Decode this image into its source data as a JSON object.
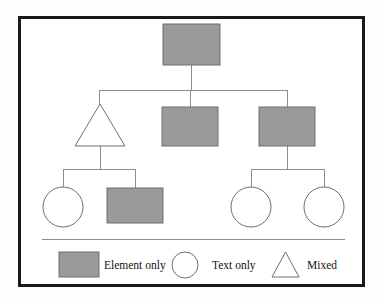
{
  "figure": {
    "name": "document-tree-diagram",
    "background_color": "#fdfdfd",
    "canvas_color": "#ffffff",
    "frame": {
      "border_color": "#1c1a19",
      "border_width": 3,
      "x": 18,
      "y": 16,
      "width": 347,
      "height": 271
    },
    "line_color": "#8c8c8c",
    "shape_stroke_color": "#6f6f6f",
    "element_fill_color": "#9a9a9a",
    "text_fill_color": "#ffffff",
    "separator": {
      "color": "#8c8c8c",
      "x1": 42,
      "x2": 345,
      "y": 239
    }
  },
  "tree": {
    "nodes": [
      {
        "id": "root",
        "shape": "rectangle",
        "category": "Element only",
        "level": 0,
        "x": 163,
        "y": 24,
        "width": 57,
        "height": 41,
        "cx": 191.5,
        "cy": 44.5
      },
      {
        "id": "n1",
        "shape": "triangle",
        "category": "Mixed",
        "level": 1,
        "apex_x": 100,
        "apex_y": 104,
        "base_left_x": 75,
        "base_right_x": 125,
        "base_y": 146,
        "cx": 100,
        "cy": 146
      },
      {
        "id": "n2",
        "shape": "rectangle",
        "category": "Element only",
        "level": 1,
        "x": 162,
        "y": 107,
        "width": 56,
        "height": 39,
        "cx": 190,
        "cy": 126.5
      },
      {
        "id": "n3",
        "shape": "rectangle",
        "category": "Element only",
        "level": 1,
        "x": 259,
        "y": 107,
        "width": 56,
        "height": 39,
        "cx": 287,
        "cy": 126.5
      },
      {
        "id": "n4",
        "shape": "circle",
        "category": "Text only",
        "level": 2,
        "cx": 63,
        "cy": 207,
        "r": 20
      },
      {
        "id": "n5",
        "shape": "rectangle",
        "category": "Element only",
        "level": 2,
        "x": 107,
        "y": 188,
        "width": 56,
        "height": 35,
        "cx": 135,
        "cy": 205.5
      },
      {
        "id": "n6",
        "shape": "circle",
        "category": "Text only",
        "level": 2,
        "cx": 251,
        "cy": 207,
        "r": 20
      },
      {
        "id": "n7",
        "shape": "circle",
        "category": "Text only",
        "level": 2,
        "cx": 324,
        "cy": 207,
        "r": 20
      }
    ],
    "edges": [
      {
        "from": "root",
        "to": "n1"
      },
      {
        "from": "root",
        "to": "n2"
      },
      {
        "from": "root",
        "to": "n3"
      },
      {
        "from": "n1",
        "to": "n4"
      },
      {
        "from": "n1",
        "to": "n5"
      },
      {
        "from": "n3",
        "to": "n6"
      },
      {
        "from": "n3",
        "to": "n7"
      }
    ],
    "connectors": {
      "root_stem": {
        "x": 191.5,
        "y1": 65,
        "y2": 90
      },
      "root_bus": {
        "y": 90,
        "x1": 99,
        "x2": 287
      },
      "root_drop_left": {
        "x": 99,
        "y1": 90,
        "y2": 106
      },
      "root_drop_mid": {
        "x": 190,
        "y1": 90,
        "y2": 107
      },
      "root_drop_right": {
        "x": 287,
        "y1": 90,
        "y2": 107
      },
      "n1_stem": {
        "x": 100,
        "y1": 146,
        "y2": 169
      },
      "n1_bus": {
        "y": 169,
        "x1": 63,
        "x2": 135
      },
      "n1_drop_left": {
        "x": 63,
        "y1": 169,
        "y2": 187
      },
      "n1_drop_right": {
        "x": 135,
        "y1": 169,
        "y2": 188
      },
      "n3_stem": {
        "x": 287,
        "y1": 146,
        "y2": 169
      },
      "n3_bus": {
        "y": 169,
        "x1": 251,
        "x2": 324
      },
      "n3_drop_left": {
        "x": 251,
        "y1": 169,
        "y2": 187
      },
      "n3_drop_right": {
        "x": 324,
        "y1": 169,
        "y2": 187
      }
    }
  },
  "legend": {
    "items": [
      {
        "label": "Element only",
        "shape": "rectangle",
        "swatch": {
          "x": 59,
          "y": 252,
          "width": 40,
          "height": 25
        },
        "label_x": 104,
        "label_y": 269
      },
      {
        "label": "Text only",
        "shape": "circle",
        "swatch": {
          "cx": 185,
          "cy": 265,
          "r": 13
        },
        "label_x": 212,
        "label_y": 269
      },
      {
        "label": "Mixed",
        "shape": "triangle",
        "swatch": {
          "apex_x": 285.5,
          "apex_y": 252,
          "base_left_x": 272,
          "base_right_x": 299,
          "base_y": 277
        },
        "label_x": 307,
        "label_y": 269
      }
    ]
  }
}
